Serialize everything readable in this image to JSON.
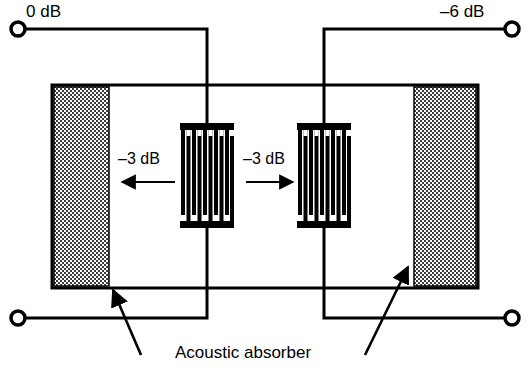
{
  "figure": {
    "kind": "saw-delay-line-schematic",
    "title_text": "",
    "labels": {
      "input_terminal": "0 dB",
      "output_terminal": "–6 dB",
      "left_propagation": "–3 dB",
      "right_propagation": "–3 dB",
      "absorber_caption": "Acoustic absorber"
    },
    "colors": {
      "ink": "#000000",
      "background": "#ffffff",
      "absorber_fill": "#8c8c8c",
      "absorber_dither_dark": "#3a3a3a"
    },
    "substrate": {
      "x": 52,
      "y": 85,
      "width": 426,
      "height": 203,
      "stroke_width": 3
    },
    "absorbers": [
      {
        "name": "left-absorber",
        "x": 54,
        "y": 87,
        "width": 55,
        "height": 199
      },
      {
        "name": "right-absorber",
        "x": 414,
        "y": 87,
        "width": 62,
        "height": 199
      }
    ],
    "transducers": [
      {
        "name": "left-idt",
        "x": 180,
        "y": 123,
        "width": 54,
        "height": 105,
        "finger_count": 5,
        "bus_bar_thickness": 7,
        "finger_width": 4
      },
      {
        "name": "right-idt",
        "x": 297,
        "y": 123,
        "width": 54,
        "height": 105,
        "finger_count": 5,
        "bus_bar_thickness": 7,
        "finger_width": 4
      }
    ],
    "terminals": [
      {
        "name": "input-top-terminal",
        "cx": 18,
        "cy": 29,
        "r": 7
      },
      {
        "name": "output-top-terminal",
        "cx": 512,
        "cy": 29,
        "r": 7
      },
      {
        "name": "input-bottom-terminal",
        "cx": 18,
        "cy": 318,
        "r": 7
      },
      {
        "name": "output-bottom-terminal",
        "cx": 512,
        "cy": 318,
        "r": 7
      }
    ],
    "arrows": {
      "left_propagation_direction": "left",
      "right_propagation_direction": "right",
      "absorber_pointer_count": 2
    }
  }
}
